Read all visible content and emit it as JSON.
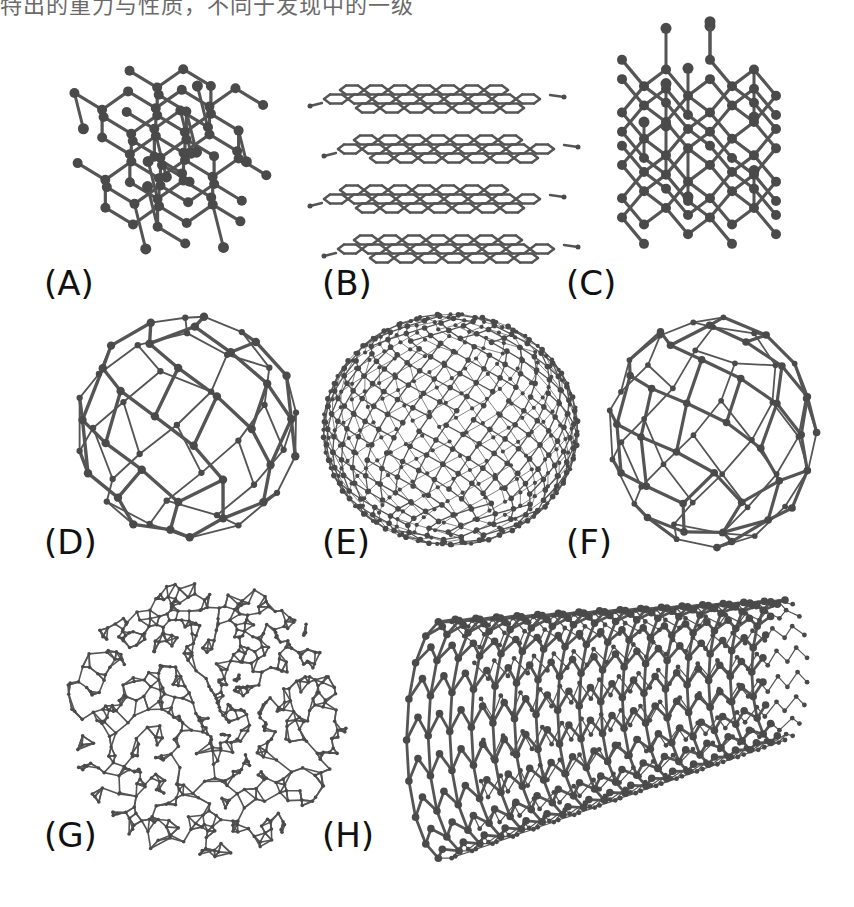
{
  "figure": {
    "top_caption_clipped": "特出的重力与性质，不同于发现中的一级",
    "background": "#ffffff",
    "bond_color": "#555555",
    "atom_color": "#4a4a4a",
    "label_color": "#111111"
  },
  "panels": [
    {
      "id": "A",
      "label": "(A)",
      "structure": "diamond-lattice",
      "box": {
        "x": 60,
        "y": 40,
        "w": 250,
        "h": 240
      },
      "label_pos": {
        "x": 44,
        "y": 266
      }
    },
    {
      "id": "B",
      "label": "(B)",
      "structure": "graphite-layers",
      "box": {
        "x": 318,
        "y": 85,
        "w": 255,
        "h": 170
      },
      "label_pos": {
        "x": 322,
        "y": 266
      }
    },
    {
      "id": "C",
      "label": "(C)",
      "structure": "lonsdaleite-lattice",
      "box": {
        "x": 590,
        "y": 50,
        "w": 240,
        "h": 230
      },
      "label_pos": {
        "x": 566,
        "y": 266
      }
    },
    {
      "id": "D",
      "label": "(D)",
      "structure": "c60-fullerene",
      "box": {
        "x": 60,
        "y": 305,
        "w": 255,
        "h": 245
      },
      "label_pos": {
        "x": 44,
        "y": 525
      }
    },
    {
      "id": "E",
      "label": "(E)",
      "structure": "c540-fullerene",
      "box": {
        "x": 318,
        "y": 312,
        "w": 265,
        "h": 235
      },
      "label_pos": {
        "x": 322,
        "y": 525
      }
    },
    {
      "id": "F",
      "label": "(F)",
      "structure": "c70-fullerene",
      "box": {
        "x": 595,
        "y": 312,
        "w": 235,
        "h": 240
      },
      "label_pos": {
        "x": 566,
        "y": 525
      }
    },
    {
      "id": "G",
      "label": "(G)",
      "structure": "amorphous-carbon",
      "box": {
        "x": 60,
        "y": 580,
        "w": 290,
        "h": 280
      },
      "label_pos": {
        "x": 44,
        "y": 818
      }
    },
    {
      "id": "H",
      "label": "(H)",
      "structure": "carbon-nanotube",
      "box": {
        "x": 355,
        "y": 590,
        "w": 455,
        "h": 270
      },
      "label_pos": {
        "x": 322,
        "y": 818
      }
    }
  ]
}
